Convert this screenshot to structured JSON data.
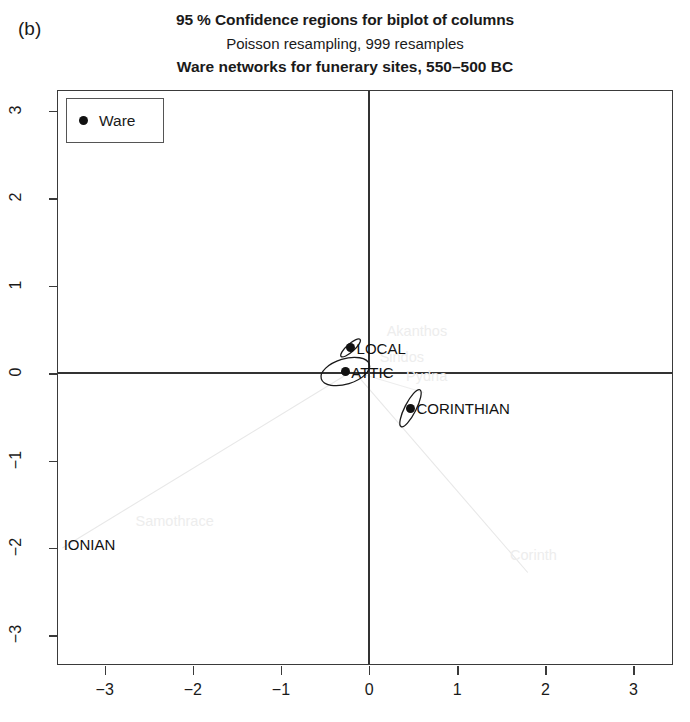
{
  "panel": {
    "letter": "(b)"
  },
  "title": {
    "line1": "95 % Confidence regions for biplot of columns",
    "line2": "Poisson resampling, 999 resamples",
    "line3": "Ware networks for funerary sites, 550–500 BC"
  },
  "legend": {
    "label": "Ware",
    "marker": "filled-circle",
    "marker_color": "#111111"
  },
  "chart_data": {
    "type": "scatter",
    "title": "95 % Confidence regions for biplot of columns",
    "subtitle": "Poisson resampling, 999 resamples",
    "subtitle2": "Ware networks for funerary sites, 550–500 BC",
    "xlabel": "",
    "ylabel": "",
    "xlim": [
      -3.53,
      3.46
    ],
    "ylim": [
      -3.35,
      3.23
    ],
    "xticks": [
      -3,
      -2,
      -1,
      0,
      1,
      2,
      3
    ],
    "yticks": [
      -3,
      -2,
      -1,
      0,
      1,
      2,
      3
    ],
    "xticklabels": [
      "−3",
      "−2",
      "−1",
      "0",
      "1",
      "2",
      "3"
    ],
    "yticklabels": [
      "−3",
      "−2",
      "−1",
      "0",
      "1",
      "2",
      "3"
    ],
    "grid": false,
    "legend_position": "top-left",
    "axis_lines": {
      "x_zero": 0,
      "y_zero": 0
    },
    "series": [
      {
        "name": "Ware",
        "marker": "filled-circle",
        "color": "#111111",
        "points": [
          {
            "label": "LOCAL",
            "x": -0.21,
            "y": 0.29,
            "ellipse": {
              "rx": 0.145,
              "ry": 0.045,
              "angle": -42
            }
          },
          {
            "label": "ATTIC",
            "x": -0.27,
            "y": 0.02,
            "ellipse": {
              "rx": 0.285,
              "ry": 0.145,
              "angle": -17
            }
          },
          {
            "label": "CORINTHIAN",
            "x": 0.47,
            "y": -0.4,
            "ellipse": {
              "rx": 0.235,
              "ry": 0.065,
              "angle": -63
            }
          }
        ]
      }
    ],
    "site_labels": [
      {
        "text": "Akanthos",
        "x": 0.2,
        "y": 0.47
      },
      {
        "text": "Sindos",
        "x": 0.12,
        "y": 0.17
      },
      {
        "text": "Pydna",
        "x": 0.42,
        "y": -0.04
      },
      {
        "text": "Samothrace",
        "x": -2.65,
        "y": -1.7
      },
      {
        "text": "Corinth",
        "x": 1.6,
        "y": -2.09
      }
    ],
    "outer_labels": [
      {
        "text": "IONIAN",
        "x": -3.5,
        "y": -1.97
      }
    ],
    "rays": [
      {
        "from": [
          -0.2,
          0.02
        ],
        "to": [
          -3.48,
          -2.0
        ],
        "color": "#e8e8e8"
      },
      {
        "from": [
          -0.18,
          0.03
        ],
        "to": [
          1.8,
          -2.28
        ],
        "color": "#e8e8e8"
      },
      {
        "from": [
          -0.18,
          0.02
        ],
        "to": [
          0.62,
          -0.22
        ],
        "color": "#ededed"
      }
    ]
  }
}
